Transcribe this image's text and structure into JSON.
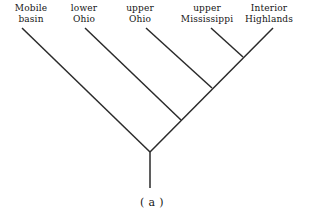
{
  "figure": {
    "type": "cladogram",
    "caption": "( a )",
    "caption_x": 152,
    "caption_y": 196,
    "line_color": "#2a2a2a",
    "line_width": 1.5,
    "background_color": "#ffffff",
    "width": 310,
    "height": 217
  },
  "taxa": [
    {
      "id": "mobile-basin",
      "label_lines": [
        "Mobile",
        "basin"
      ],
      "line1": "Mobile",
      "line2": "basin",
      "label_x": 31,
      "label_y": 3,
      "tip_x": 22,
      "tip_y": 28
    },
    {
      "id": "lower-ohio",
      "label_lines": [
        "lower",
        "Ohio"
      ],
      "line1": "lower",
      "line2": "Ohio",
      "label_x": 84,
      "label_y": 3,
      "tip_x": 85,
      "tip_y": 28
    },
    {
      "id": "upper-ohio",
      "label_lines": [
        "upper",
        "Ohio"
      ],
      "line1": "upper",
      "line2": "Ohio",
      "label_x": 140,
      "label_y": 3,
      "tip_x": 146,
      "tip_y": 28
    },
    {
      "id": "upper-mississippi",
      "label_lines": [
        "upper",
        "Mississippi"
      ],
      "line1": "upper",
      "line2": "Mississippi",
      "label_x": 207,
      "label_y": 3,
      "tip_x": 211,
      "tip_y": 28
    },
    {
      "id": "interior-highlands",
      "label_lines": [
        "Interior",
        "Highlands"
      ],
      "line1": "Interior",
      "line2": "Highlands",
      "label_x": 269,
      "label_y": 3,
      "tip_x": 273,
      "tip_y": 28
    }
  ],
  "nodes": [
    {
      "id": "node-root",
      "x": 150,
      "y": 152
    },
    {
      "id": "node-2",
      "x": 181,
      "y": 120
    },
    {
      "id": "node-3",
      "x": 212,
      "y": 88
    },
    {
      "id": "node-4",
      "x": 243,
      "y": 57
    },
    {
      "id": "root-stem-end",
      "x": 150,
      "y": 188
    }
  ],
  "branches": [
    {
      "id": "branch-mobile-basin",
      "x1": 22,
      "y1": 28,
      "x2": 150,
      "y2": 152
    },
    {
      "id": "branch-lower-ohio",
      "x1": 85,
      "y1": 28,
      "x2": 181,
      "y2": 120
    },
    {
      "id": "branch-upper-ohio",
      "x1": 146,
      "y1": 28,
      "x2": 212,
      "y2": 88
    },
    {
      "id": "branch-upper-mississippi",
      "x1": 211,
      "y1": 28,
      "x2": 243,
      "y2": 57
    },
    {
      "id": "branch-interior-highlands",
      "x1": 273,
      "y1": 28,
      "x2": 150,
      "y2": 152
    },
    {
      "id": "branch-root-stem",
      "x1": 150,
      "y1": 152,
      "x2": 150,
      "y2": 188
    }
  ]
}
